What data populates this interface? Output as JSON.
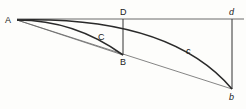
{
  "diagram": {
    "type": "geometric-curves",
    "colors": {
      "line": "#2a2a2a",
      "thin_line": "#555555",
      "background": "#fdfdfb"
    },
    "points": {
      "A": {
        "label": "A",
        "x": 17,
        "y": 20
      },
      "D": {
        "label": "D",
        "x": 123,
        "y": 19
      },
      "B": {
        "label": "B",
        "x": 123,
        "y": 55
      },
      "d": {
        "label": "d",
        "x": 232,
        "y": 19
      },
      "b": {
        "label": "b",
        "x": 232,
        "y": 89
      }
    },
    "curve_labels": {
      "C": {
        "label": "C",
        "x": 101,
        "y": 37
      },
      "c": {
        "label": "c",
        "x": 188,
        "y": 52
      }
    },
    "elements": [
      {
        "name": "horizontal-line-A-d",
        "kind": "line",
        "from": "A",
        "to": "d"
      },
      {
        "name": "vertical-line-D-B",
        "kind": "line",
        "from": "D",
        "to": "B"
      },
      {
        "name": "vertical-line-d-b",
        "kind": "line",
        "from": "d",
        "to": "b"
      },
      {
        "name": "chord-A-B",
        "kind": "line",
        "from": "A",
        "to": "B"
      },
      {
        "name": "chord-A-b",
        "kind": "line",
        "from": "A",
        "to": "b"
      },
      {
        "name": "curve-C-A-B",
        "kind": "curve",
        "from": "A",
        "to": "B"
      },
      {
        "name": "curve-c-A-b",
        "kind": "curve",
        "from": "A",
        "to": "b"
      }
    ]
  }
}
